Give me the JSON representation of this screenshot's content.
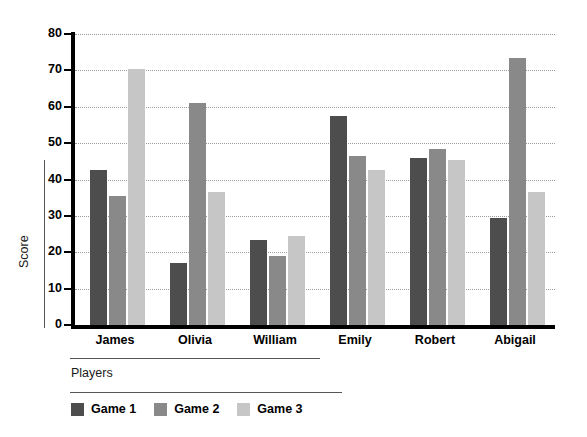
{
  "chart_data": {
    "type": "bar",
    "title": "",
    "subtitle": "",
    "xlabel": "Players",
    "ylabel": "Score",
    "categories": [
      "James",
      "Olivia",
      "William",
      "Emily",
      "Robert",
      "Abigail"
    ],
    "series": [
      {
        "name": "Game 1",
        "color": "#4d4d4d",
        "values": [
          42.5,
          17.0,
          23.5,
          57.5,
          46.0,
          29.5
        ]
      },
      {
        "name": "Game 2",
        "color": "#898989",
        "values": [
          35.5,
          61.0,
          19.0,
          46.5,
          48.5,
          73.5
        ]
      },
      {
        "name": "Game 3",
        "color": "#c6c6c6",
        "values": [
          70.5,
          36.5,
          24.5,
          42.5,
          45.5,
          36.5
        ]
      }
    ],
    "ylim": [
      0,
      80
    ],
    "yticks": [
      0,
      10,
      20,
      30,
      40,
      50,
      60,
      70,
      80
    ],
    "ytick_labels": [
      "0",
      "10",
      "20",
      "30",
      "40",
      "50",
      "60",
      "70",
      "80"
    ],
    "grid": "horizontal-dotted",
    "legend_position": "bottom-left",
    "axis_color": "#000000",
    "grid_color": "#9a9a9a",
    "background": "#ffffff"
  }
}
